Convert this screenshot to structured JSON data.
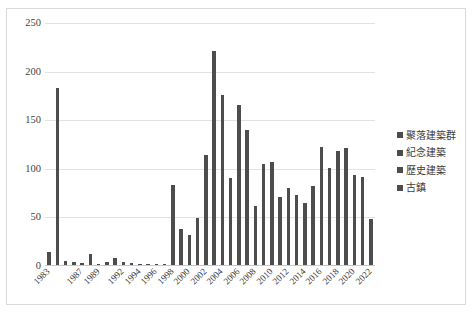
{
  "chart_data": {
    "type": "bar",
    "title": "",
    "subtitle": "",
    "xlabel": "",
    "ylabel": "",
    "ylim": [
      0,
      250
    ],
    "yticks": [
      0,
      50,
      100,
      150,
      200,
      250
    ],
    "ytick_labels": [
      "0",
      "50",
      "100",
      "150",
      "200",
      "250"
    ],
    "grid": true,
    "legend_position": "right",
    "bar_color": "#4d4d4d",
    "categories": [
      "1983",
      "1984",
      "1985",
      "1986",
      "1987",
      "1988",
      "1989",
      "1990",
      "1991",
      "1992",
      "1993",
      "1994",
      "1995",
      "1996",
      "1997",
      "1998",
      "1999",
      "2000",
      "2001",
      "2002",
      "2003",
      "2004",
      "2005",
      "2006",
      "2007",
      "2008",
      "2009",
      "2010",
      "2011",
      "2012",
      "2013",
      "2014",
      "2015",
      "2016",
      "2017",
      "2018",
      "2019",
      "2020",
      "2021",
      "2022"
    ],
    "xtick_labels": [
      "1983",
      "1987",
      "1989",
      "1992",
      "1994",
      "1996",
      "1998",
      "2000",
      "2002",
      "2004",
      "2006",
      "2008",
      "2010",
      "2012",
      "2014",
      "2016",
      "2018",
      "2020",
      "2022"
    ],
    "series": [
      {
        "name": "古鎮",
        "values": [
          14,
          183,
          5,
          4,
          3,
          12,
          2,
          4,
          8,
          4,
          3,
          2,
          2,
          2,
          2,
          83,
          38,
          32,
          49,
          114,
          221,
          176,
          91,
          166,
          140,
          62,
          105,
          107,
          71,
          80,
          73,
          65,
          82,
          122,
          101,
          118,
          121,
          94,
          92,
          48
        ]
      }
    ],
    "legend_entries": [
      {
        "label": "聚落建築群",
        "color": "#4d4d4d"
      },
      {
        "label": "紀念建築",
        "color": "#4d4d4d"
      },
      {
        "label": "歷史建築",
        "color": "#4d4d4d"
      },
      {
        "label": "古鎮",
        "color": "#4d4d4d"
      }
    ]
  }
}
